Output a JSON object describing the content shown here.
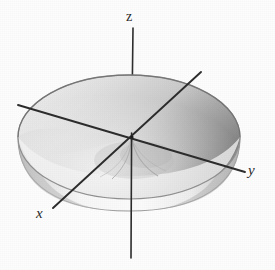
{
  "figure": {
    "kind": "3d-surface-plot",
    "background_color": "#fdfdfd",
    "line_color": "#2b2b2b",
    "surface": {
      "name": "paraboloid-bowl",
      "rim_center_x": 129,
      "rim_center_y": 137,
      "rim_radius_x": 111,
      "rim_radius_y": 62,
      "depth": 73,
      "interior_light_color": "#e9e9e9",
      "interior_dark_color": "#8d8d8d",
      "exterior_light_color": "#fbfbfb",
      "exterior_shadow_color": "#c9c9c9",
      "rim_stroke_color": "#8a8a8a"
    },
    "axes": [
      {
        "name": "z-axis",
        "label": "z",
        "italic": false,
        "x1": 133,
        "y1": 28,
        "x2": 131,
        "y2": 258,
        "label_x": 126,
        "label_y": 10
      },
      {
        "name": "y-axis",
        "label": "y",
        "italic": true,
        "x1": 18,
        "y1": 105,
        "x2": 245,
        "y2": 172,
        "label_x": 248,
        "label_y": 163
      },
      {
        "name": "x-axis",
        "label": "x",
        "italic": true,
        "x1": 201,
        "y1": 72,
        "x2": 53,
        "y2": 208,
        "label_x": 36,
        "label_y": 206
      }
    ],
    "labels": {
      "z": "z",
      "y": "y",
      "x": "x"
    }
  }
}
